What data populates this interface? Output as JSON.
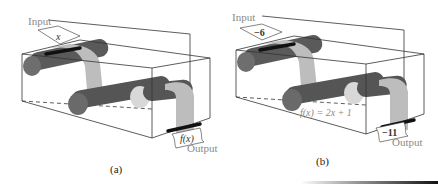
{
  "panels": [
    {
      "id": "a",
      "caption": "(a)",
      "input_label": "Input",
      "output_label": "Output",
      "input_value": "x",
      "output_value": "f(x)",
      "function_label": ""
    },
    {
      "id": "b",
      "caption": "(b)",
      "input_label": "Input",
      "output_label": "Output",
      "input_value": "−6",
      "output_value": "−11",
      "function_label": "f(x) = 2x + 1"
    }
  ],
  "colors": {
    "roller_dark": "#5a5a5a",
    "roller_end": "#6e6e6e",
    "roller_light": "#d8d8d8",
    "paper": "#bdbdbd",
    "box_line": "#333333",
    "label_gray": "#8a8a8a"
  }
}
